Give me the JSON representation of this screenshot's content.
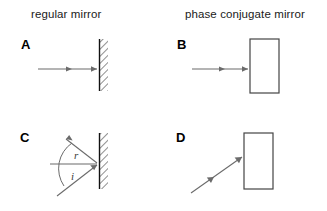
{
  "figure": {
    "title_left": "regular mirror",
    "title_right": "phase conjugate mirror",
    "background_color": "#ffffff",
    "ray_color": "#6b6b6b",
    "mirror_color": "#111111"
  },
  "headers": {
    "left": "regular mirror",
    "right": "phase conjugate mirror"
  },
  "panels": [
    {
      "letter": "A",
      "mirror_type": "regular-hatched-mirror",
      "ray_description": "normal-incidence ray travelling left to right onto mirror",
      "ray_arrow_count": 2,
      "angle_labels": []
    },
    {
      "letter": "B",
      "mirror_type": "phase-conjugate-striped-mirror",
      "ray_description": "normal-incidence ray travelling left to right into phase conjugate mirror",
      "ray_arrow_count": 2,
      "angle_labels": []
    },
    {
      "letter": "C",
      "mirror_type": "regular-hatched-mirror",
      "ray_description": "oblique incident ray and reflected ray about the normal",
      "ray_arrow_count": 2,
      "angle_labels": [
        "r",
        "i"
      ]
    },
    {
      "letter": "D",
      "mirror_type": "phase-conjugate-striped-mirror",
      "ray_description": "oblique ray travelling up-right into phase conjugate mirror",
      "ray_arrow_count": 2,
      "angle_labels": []
    }
  ],
  "labels": {
    "angle_reflection": "r",
    "angle_incidence": "i"
  }
}
